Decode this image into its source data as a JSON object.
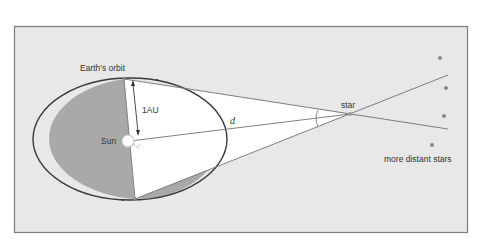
{
  "diagram": {
    "labels": {
      "earth_orbit": "Earth's orbit",
      "au": "1AU",
      "sun": "Sun",
      "distance": "d",
      "star": "star",
      "distant_stars": "more distant stars"
    },
    "colors": {
      "panel_bg": "#e8e8e8",
      "panel_border": "#7a7a7a",
      "shaded_orbit": "#a9a9a9",
      "triangle_fill": "#ffffff",
      "orbit_line": "#3a3a3a",
      "sight_lines": "#707070"
    }
  }
}
